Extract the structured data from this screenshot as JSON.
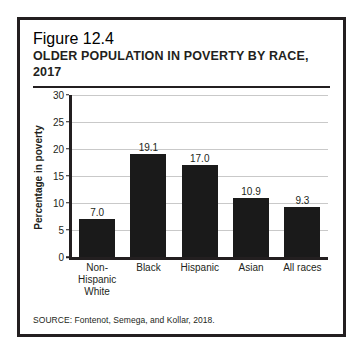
{
  "figure": {
    "number": "Figure 12.4",
    "title": "OLDER POPULATION IN POVERTY BY RACE, 2017",
    "source": "SOURCE: Fontenot, Semega, and Kollar, 2018."
  },
  "chart_data": {
    "type": "bar",
    "title": "OLDER POPULATION IN POVERTY BY RACE, 2017",
    "categories": [
      "Non-Hispanic White",
      "Black",
      "Hispanic",
      "Asian",
      "All races"
    ],
    "category_lines": [
      [
        "Non-Hispanic",
        "White"
      ],
      [
        "Black"
      ],
      [
        "Hispanic"
      ],
      [
        "Asian"
      ],
      [
        "All races"
      ]
    ],
    "values": [
      7.0,
      19.1,
      17.0,
      10.9,
      9.3
    ],
    "value_labels": [
      "7.0",
      "19.1",
      "17.0",
      "10.9",
      "9.3"
    ],
    "xlabel": "",
    "ylabel": "Percentage in poverty",
    "ylim": [
      0,
      30
    ],
    "ytick_values": [
      0,
      5,
      10,
      15,
      20,
      25,
      30
    ],
    "ytick_labels": [
      "0",
      "5",
      "10",
      "15",
      "20",
      "25",
      "30"
    ],
    "grid": true,
    "legend": false,
    "bar_color": "#1a1a1a",
    "gridline_color": "#c9c9c9",
    "axis_color": "#231f20"
  }
}
